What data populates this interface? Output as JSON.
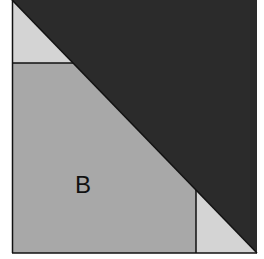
{
  "diagram": {
    "label": "B",
    "colors": {
      "dark_triangle": "#2b2b2b",
      "light_triangle": "#d4d4d4",
      "region_b": "#a8a8a8",
      "stroke": "#111111",
      "background": "#ffffff"
    }
  }
}
